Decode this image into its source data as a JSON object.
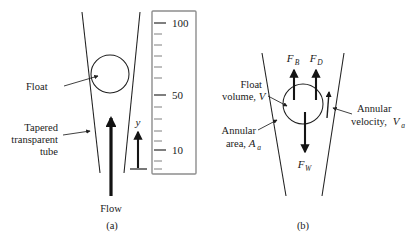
{
  "figure": {
    "stroke_color": "#1f1f1f",
    "scale_box_color": "#8d8d8d",
    "background": "#ffffff"
  },
  "panel_a": {
    "caption": "(a)",
    "labels": {
      "float": "Float",
      "tube_line1": "Tapered",
      "tube_line2": "transparent",
      "tube_line3": "tube",
      "flow": "Flow",
      "height_symbol": "y"
    },
    "scale": {
      "tick_labels": [
        "100",
        "50",
        "10"
      ],
      "tick_label_values": [
        100,
        50,
        10
      ],
      "minor_tick_count": 13
    }
  },
  "panel_b": {
    "caption": "(b)",
    "labels": {
      "float_volume_line1": "Float",
      "float_volume_line2": "volume,",
      "float_volume_symbol": "V",
      "annular_area_line1": "Annular",
      "annular_area_line2": "area,",
      "annular_area_symbol": "A",
      "annular_area_subscript": "a",
      "annular_velocity_line1": "Annular",
      "annular_velocity_line2": "velocity,",
      "annular_velocity_symbol": "V",
      "annular_velocity_subscript": "a"
    },
    "forces": [
      {
        "symbol": "F",
        "subscript": "B",
        "name": "buoyancy-force",
        "direction": "up"
      },
      {
        "symbol": "F",
        "subscript": "D",
        "name": "drag-force",
        "direction": "up"
      },
      {
        "symbol": "F",
        "subscript": "W",
        "name": "weight-force",
        "direction": "down"
      }
    ]
  }
}
